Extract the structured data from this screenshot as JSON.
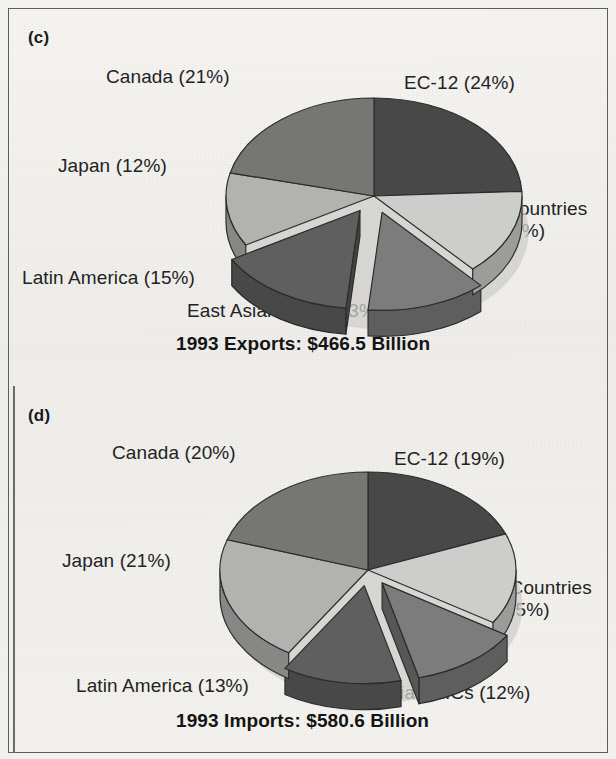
{
  "figure": {
    "background_color": "#f2f1ee",
    "frame_color": "#5d5d5d",
    "text_color": "#232323"
  },
  "panels": [
    {
      "letter": "(c)",
      "caption": "1993 Exports: $466.5 Billion",
      "labels": [
        {
          "text": "Canada (21%)"
        },
        {
          "text": "EC-12 (24%)"
        },
        {
          "text": "Other Countries",
          "text2": "(14%)"
        },
        {
          "text": "Japan (12%)"
        },
        {
          "text": "Latin America (15%)"
        },
        {
          "text": "East Asian NICs (13%)"
        }
      ]
    },
    {
      "letter": "(d)",
      "caption": "1993 Imports: $580.6 Billion",
      "labels": [
        {
          "text": "Canada (20%)"
        },
        {
          "text": "EC-12 (19%)"
        },
        {
          "text": "Other Countries",
          "text2": "(15%)"
        },
        {
          "text": "Japan (21%)"
        },
        {
          "text": "Latin America (13%)"
        },
        {
          "text": "East Asian NICs (12%)"
        }
      ]
    }
  ],
  "chart_data": [
    {
      "type": "pie",
      "title": "1993 Exports: $466.5 Billion",
      "panel": "(c)",
      "total_value": 466.5,
      "units": "Billion US$",
      "categories": [
        "EC-12",
        "Other Countries",
        "East Asian NICs",
        "Latin America",
        "Japan",
        "Canada"
      ],
      "values": [
        24,
        14,
        13,
        15,
        12,
        21
      ],
      "value_unit": "percent",
      "labels": [
        "EC-12 (24%)",
        "Other Countries (14%)",
        "East Asian NICs (13%)",
        "Latin America (15%)",
        "Japan (12%)",
        "Canada (21%)"
      ],
      "colors": [
        "#484848",
        "#cdcdcb",
        "#7c7c7c",
        "#5f5f5f",
        "#b2b2b0",
        "#767674"
      ],
      "exploded": [
        "East Asian NICs",
        "Latin America"
      ],
      "legend": "none",
      "start_angle_deg": 0,
      "direction": "clockwise",
      "three_d": true
    },
    {
      "type": "pie",
      "title": "1993 Imports: $580.6 Billion",
      "panel": "(d)",
      "total_value": 580.6,
      "units": "Billion US$",
      "categories": [
        "EC-12",
        "Other Countries",
        "East Asian NICs",
        "Latin America",
        "Japan",
        "Canada"
      ],
      "values": [
        19,
        15,
        12,
        13,
        21,
        20
      ],
      "value_unit": "percent",
      "labels": [
        "EC-12 (19%)",
        "Other Countries (15%)",
        "East Asian NICs (12%)",
        "Latin America (13%)",
        "Japan (21%)",
        "Canada (20%)"
      ],
      "colors": [
        "#484848",
        "#cdcdcb",
        "#7c7c7c",
        "#5f5f5f",
        "#b2b2b0",
        "#767674"
      ],
      "exploded": [
        "East Asian NICs",
        "Latin America"
      ],
      "legend": "none",
      "start_angle_deg": 0,
      "direction": "clockwise",
      "three_d": true
    }
  ]
}
